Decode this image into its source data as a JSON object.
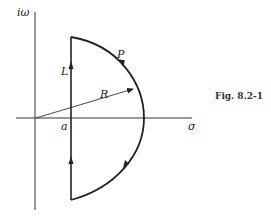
{
  "figure": {
    "caption": "Fig. 8.2-1",
    "axes": {
      "vertical_label": "iω",
      "horizontal_label": "σ"
    },
    "contour": {
      "line_label": "L",
      "arc_label": "P",
      "radius_label": "R",
      "offset_label": "a"
    }
  }
}
